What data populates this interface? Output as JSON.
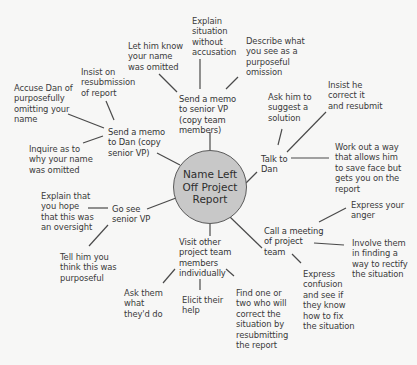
{
  "diagram": {
    "type": "mind-map",
    "line_color": "#4a4a4a",
    "center": {
      "label": "Name Left\nOff Project\nReport",
      "fill": "#c8c8c8"
    },
    "branches": [
      {
        "id": "memo_vp",
        "label": "Send a memo\nto senior VP\n(copy team\nmembers)",
        "children": [
          "Let him know\nyour name\nwas omitted",
          "Explain\nsituation\nwithout\naccusation",
          "Describe what\nyou see as a\npurposeful\nomission"
        ]
      },
      {
        "id": "talk_dan",
        "label": "Talk to\nDan",
        "children": [
          "Ask him to\nsuggest a\nsolution",
          "Insist he\ncorrect it\nand resubmit",
          "Work out a way\nthat allows him\nto save face but\ngets you on the\nreport"
        ]
      },
      {
        "id": "meeting",
        "label": "Call a meeting\nof project\nteam",
        "children": [
          "Express your\nanger",
          "Involve them\nin finding a\nway to rectify\nthe situation",
          "Express\nconfusion\nand see if\nthey know\nhow to fix\nthe situation"
        ]
      },
      {
        "id": "visit",
        "label": "Visit other\nproject team\nmembers\nindividually",
        "children": [
          "Ask them\nwhat\nthey'd do",
          "Elicit their\nhelp",
          "Find one or\ntwo who will\ncorrect the\nsituation by\nresubmitting\nthe report"
        ]
      },
      {
        "id": "see_vp",
        "label": "Go see\nsenior VP",
        "children": [
          "Explain that\nyou hope\nthat this was\nan oversight",
          "Tell him you\nthink this was\npurposeful"
        ]
      },
      {
        "id": "memo_dan",
        "label": "Send a memo\nto Dan (copy\nsenior VP)",
        "children": [
          "Accuse Dan of\npurposefully\nomitting your\nname",
          "Insist on\nresubmission\nof report",
          "Inquire as to\nwhy your name\nwas omitted"
        ]
      }
    ]
  }
}
